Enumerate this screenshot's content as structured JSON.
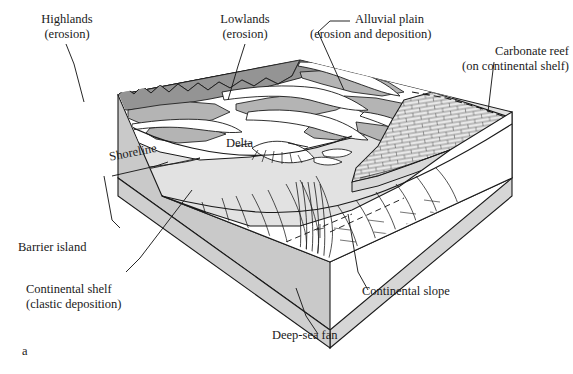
{
  "figure": {
    "marker": "a",
    "kind": "block-diagram",
    "background_color": "#ffffff",
    "line_color": "#1a1a1a"
  },
  "palette": {
    "highland_dark_gray": "#949494",
    "upland_mid_gray": "#b4b4b4",
    "shelf_light_gray": "#e2e2e2",
    "block_side_gray": "#c9c9c9",
    "block_front_gray": "#d6d6d6",
    "deep_sea_fan_gray": "#8f8f8f",
    "reef_fill": "#e8e8e8",
    "white": "#ffffff"
  },
  "labels": [
    {
      "id": "highlands",
      "line1": "Highlands",
      "line2": "(erosion)"
    },
    {
      "id": "lowlands",
      "line1": "Lowlands",
      "line2": "(erosion)"
    },
    {
      "id": "alluvial-plain",
      "line1": "Alluvial plain",
      "line2": "(erosion and deposition)"
    },
    {
      "id": "carbonate-reef",
      "line1": "Carbonate reef",
      "line2": "(on continental shelf)"
    },
    {
      "id": "continental-shelf",
      "line1": "Continental shelf",
      "line2": "(clastic deposition)"
    },
    {
      "id": "barrier-island",
      "line1": "Barrier island",
      "line2": ""
    },
    {
      "id": "shoreline",
      "line1": "Shoreline",
      "line2": ""
    },
    {
      "id": "delta",
      "line1": "Delta",
      "line2": ""
    },
    {
      "id": "continental-slope",
      "line1": "Continental slope",
      "line2": ""
    },
    {
      "id": "deep-sea-fan",
      "line1": "Deep-sea fan",
      "line2": ""
    }
  ]
}
